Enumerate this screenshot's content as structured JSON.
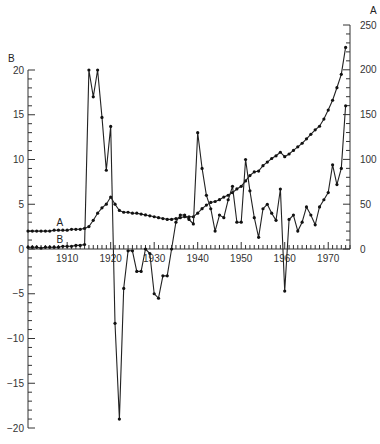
{
  "chart_data": {
    "type": "line",
    "title": "",
    "xlabel": "",
    "x_ticks": [
      1910,
      1920,
      1930,
      1940,
      1950,
      1960,
      1970
    ],
    "xlim": [
      1900,
      1975
    ],
    "left_axis": {
      "label": "B",
      "ylim": [
        -20,
        20
      ],
      "ticks": [
        -20,
        -15,
        -10,
        -5,
        0,
        5,
        10,
        15,
        20
      ]
    },
    "right_axis": {
      "label": "A",
      "ylim": [
        0,
        250
      ],
      "ticks": [
        0,
        50,
        100,
        150,
        200,
        250
      ]
    },
    "grid": false,
    "series": [
      {
        "name": "A",
        "axis": "right",
        "x": [
          1901,
          1902,
          1903,
          1904,
          1905,
          1906,
          1907,
          1908,
          1909,
          1910,
          1911,
          1912,
          1913,
          1914,
          1915,
          1916,
          1917,
          1918,
          1919,
          1920,
          1921,
          1922,
          1923,
          1924,
          1925,
          1926,
          1927,
          1928,
          1929,
          1930,
          1931,
          1932,
          1933,
          1934,
          1935,
          1936,
          1937,
          1938,
          1939,
          1940,
          1941,
          1942,
          1943,
          1944,
          1945,
          1946,
          1947,
          1948,
          1949,
          1950,
          1951,
          1952,
          1953,
          1954,
          1955,
          1956,
          1957,
          1958,
          1959,
          1960,
          1961,
          1962,
          1963,
          1964,
          1965,
          1966,
          1967,
          1968,
          1969,
          1970,
          1971,
          1972,
          1973,
          1974
        ],
        "values": [
          20,
          20,
          20,
          20,
          20,
          20,
          21,
          21,
          21,
          21,
          22,
          22,
          22,
          23,
          25,
          32,
          40,
          46,
          50,
          58,
          50,
          43,
          41,
          41,
          40,
          40,
          39,
          38,
          37,
          36,
          35,
          34,
          33,
          33,
          34,
          35,
          36,
          36,
          36,
          40,
          45,
          49,
          52,
          53,
          55,
          58,
          60,
          63,
          67,
          70,
          76,
          82,
          86,
          87,
          93,
          97,
          101,
          104,
          108,
          103,
          106,
          110,
          114,
          118,
          123,
          128,
          133,
          137,
          145,
          155,
          166,
          180,
          195,
          225
        ]
      },
      {
        "name": "B",
        "axis": "left",
        "x": [
          1901,
          1902,
          1903,
          1904,
          1905,
          1906,
          1907,
          1908,
          1909,
          1910,
          1911,
          1912,
          1913,
          1914,
          1915,
          1916,
          1917,
          1918,
          1919,
          1920,
          1921,
          1922,
          1923,
          1924,
          1925,
          1926,
          1927,
          1928,
          1929,
          1930,
          1931,
          1932,
          1933,
          1934,
          1935,
          1936,
          1937,
          1938,
          1939,
          1940,
          1941,
          1942,
          1943,
          1944,
          1945,
          1946,
          1947,
          1948,
          1949,
          1950,
          1951,
          1952,
          1953,
          1954,
          1955,
          1956,
          1957,
          1958,
          1959,
          1960,
          1961,
          1962,
          1963,
          1964,
          1965,
          1966,
          1967,
          1968,
          1969,
          1970,
          1971,
          1972,
          1973,
          1974
        ],
        "values": [
          0.2,
          0.2,
          0.2,
          0.1,
          0.2,
          0.2,
          0.2,
          0.2,
          0.3,
          0.3,
          0.3,
          0.4,
          0.4,
          0.5,
          20,
          17,
          20,
          14.7,
          8.8,
          13.7,
          -8.3,
          -19,
          -4.4,
          -0.2,
          -0.2,
          -2.5,
          -2.5,
          0,
          -0.5,
          -5,
          -5.5,
          -3,
          -3,
          0,
          3,
          3.8,
          3.8,
          3.3,
          2.8,
          13,
          9,
          6,
          4.5,
          2,
          3.8,
          3.5,
          5.5,
          7,
          3,
          3,
          10,
          6.5,
          3.5,
          1.3,
          4.5,
          5,
          4,
          3.2,
          6.7,
          -4.7,
          3.3,
          3.8,
          2,
          3,
          4.7,
          3.8,
          2.7,
          4.7,
          5.5,
          6.3,
          9.4,
          7.2,
          9,
          16
        ]
      }
    ],
    "annotations": [
      {
        "text": "A",
        "series": "A",
        "near_x": 1908
      },
      {
        "text": "B",
        "series": "B",
        "near_x": 1908
      }
    ]
  }
}
